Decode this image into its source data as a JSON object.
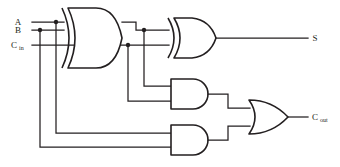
{
  "diagram": {
    "type": "logic-circuit",
    "background_color": "#ffffff",
    "line_color": "#231f20",
    "inputs": [
      {
        "id": "a",
        "label": "A",
        "subscript": "",
        "y": 22
      },
      {
        "id": "b",
        "label": "B",
        "subscript": "",
        "y": 30
      },
      {
        "id": "cin",
        "label": "C",
        "subscript": "in",
        "y": 45
      }
    ],
    "outputs": [
      {
        "id": "s",
        "label": "S",
        "subscript": "",
        "y": 38
      },
      {
        "id": "cout",
        "label": "C",
        "subscript": "out",
        "y": 117
      }
    ],
    "gates": [
      {
        "id": "xor1",
        "type": "XOR",
        "inputs": [
          "A",
          "B"
        ],
        "output": "A xor B"
      },
      {
        "id": "xor2",
        "type": "XOR",
        "inputs": [
          "A xor B",
          "Cin"
        ],
        "output": "S"
      },
      {
        "id": "and1",
        "type": "AND",
        "inputs": [
          "A xor B",
          "Cin"
        ],
        "output": "and1"
      },
      {
        "id": "and2",
        "type": "AND",
        "inputs": [
          "A",
          "B"
        ],
        "output": "and2"
      },
      {
        "id": "or1",
        "type": "OR",
        "inputs": [
          "and1",
          "and2"
        ],
        "output": "Cout"
      }
    ]
  }
}
